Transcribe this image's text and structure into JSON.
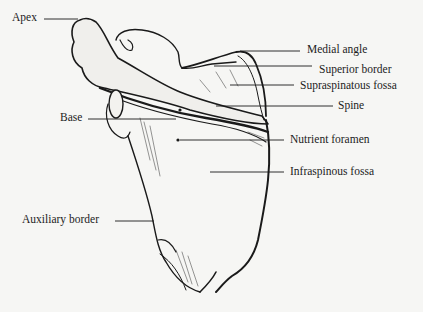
{
  "figure": {
    "labels": {
      "apex": "Apex",
      "base": "Base",
      "auxiliary_border": "Auxiliary border",
      "medial_angle": "Medial angle",
      "superior_border": "Superior border",
      "supraspinatous_fossa": "Supraspinatous fossa",
      "spine": "Spine",
      "nutrient_foramen": "Nutrient foramen",
      "infraspinous_fossa": "Infraspinous fossa"
    },
    "colors": {
      "background": "#f6f6f4",
      "ink": "#1a1a1a"
    }
  }
}
